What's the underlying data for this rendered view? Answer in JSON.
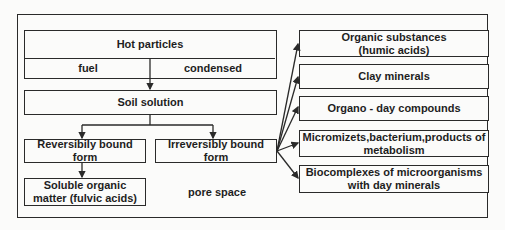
{
  "diagram": {
    "left_column": {
      "hot_particles": {
        "title": "Hot particles",
        "sub_left": "fuel",
        "sub_right": "condensed"
      },
      "soil_solution": "Soil solution",
      "reversibly_bound": "Reversibily bound form",
      "irreversibly_bound": "Irreversibly bound form",
      "soluble_organic": {
        "line1": "Soluble organic",
        "line2": "matter (fulvic acids)"
      },
      "pore_space": "pore space"
    },
    "right_column": [
      {
        "line1": "Organic substances",
        "line2": "(humic acids)"
      },
      {
        "line1": "Clay minerals",
        "line2": ""
      },
      {
        "line1": "Organo - day compounds",
        "line2": ""
      },
      {
        "line1": "Micromizets,bacterium,products of",
        "line2": "metabolism"
      },
      {
        "line1": "Biocomplexes of microorganisms",
        "line2": "with day minerals"
      }
    ]
  }
}
